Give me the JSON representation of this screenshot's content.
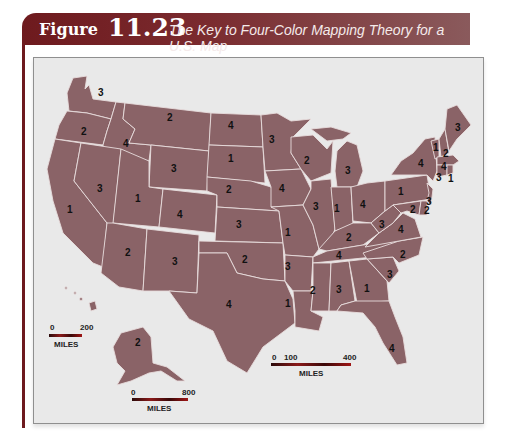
{
  "figure": {
    "label": "Figure",
    "number": "11.23",
    "title": "The Key to Four-Color Mapping Theory for a U.S. Map"
  },
  "colors": {
    "frame": "#6e1a1e",
    "land": "#8a6367",
    "borders": "#e8dcdc",
    "water": "#e9e9e9"
  },
  "states": [
    {
      "name": "Washington",
      "n": "3"
    },
    {
      "name": "Oregon",
      "n": "2"
    },
    {
      "name": "Idaho",
      "n": "4"
    },
    {
      "name": "Montana",
      "n": "2"
    },
    {
      "name": "Wyoming",
      "n": "3"
    },
    {
      "name": "Nevada",
      "n": "3"
    },
    {
      "name": "California",
      "n": "1"
    },
    {
      "name": "Utah",
      "n": "1"
    },
    {
      "name": "Colorado",
      "n": "4"
    },
    {
      "name": "Arizona",
      "n": "2"
    },
    {
      "name": "New Mexico",
      "n": "3"
    },
    {
      "name": "North Dakota",
      "n": "4"
    },
    {
      "name": "South Dakota",
      "n": "1"
    },
    {
      "name": "Nebraska",
      "n": "2"
    },
    {
      "name": "Kansas",
      "n": "3"
    },
    {
      "name": "Oklahoma",
      "n": "2"
    },
    {
      "name": "Texas",
      "n": "4"
    },
    {
      "name": "Minnesota",
      "n": "3"
    },
    {
      "name": "Iowa",
      "n": "4"
    },
    {
      "name": "Missouri",
      "n": "1"
    },
    {
      "name": "Arkansas",
      "n": "3"
    },
    {
      "name": "Louisiana",
      "n": "1"
    },
    {
      "name": "Wisconsin",
      "n": "2"
    },
    {
      "name": "Illinois",
      "n": "3"
    },
    {
      "name": "Michigan",
      "n": "3"
    },
    {
      "name": "Indiana",
      "n": "1"
    },
    {
      "name": "Ohio",
      "n": "4"
    },
    {
      "name": "Kentucky",
      "n": "2"
    },
    {
      "name": "Tennessee",
      "n": "4"
    },
    {
      "name": "Mississippi",
      "n": "2"
    },
    {
      "name": "Alabama",
      "n": "3"
    },
    {
      "name": "Georgia",
      "n": "1"
    },
    {
      "name": "Florida",
      "n": "4"
    },
    {
      "name": "South Carolina",
      "n": "3"
    },
    {
      "name": "North Carolina",
      "n": "2"
    },
    {
      "name": "Virginia",
      "n": "4"
    },
    {
      "name": "West Virginia",
      "n": "3"
    },
    {
      "name": "Pennsylvania",
      "n": "1"
    },
    {
      "name": "New York",
      "n": "2"
    },
    {
      "name": "Maryland",
      "n": "2"
    },
    {
      "name": "Delaware",
      "n": "3"
    },
    {
      "name": "New Jersey",
      "n": "4"
    },
    {
      "name": "Vermont",
      "n": "1"
    },
    {
      "name": "New Hampshire",
      "n": "2"
    },
    {
      "name": "Maine",
      "n": "3"
    },
    {
      "name": "Massachusetts",
      "n": "4"
    },
    {
      "name": "Connecticut",
      "n": "3"
    },
    {
      "name": "Rhode Island",
      "n": "1"
    },
    {
      "name": "Alaska",
      "n": "2"
    }
  ],
  "scales": {
    "hawaii": {
      "start": "0",
      "end": "200",
      "unit": "MILES"
    },
    "alaska": {
      "start": "0",
      "end": "800",
      "unit": "MILES"
    },
    "mainland": {
      "start": "0",
      "mid": "100",
      "end": "400",
      "unit": "MILES"
    }
  }
}
